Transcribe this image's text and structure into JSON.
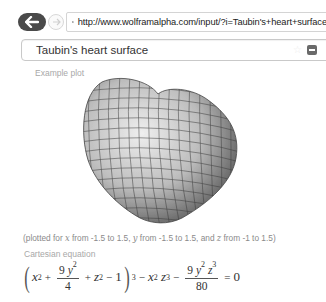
{
  "browser": {
    "url": "http://www.wolframalpha.com/input/?i=Taubin's+heart+surface",
    "back_icon": "arrow-left-icon",
    "forward_icon": "arrow-right-icon",
    "site_icon": "gear-icon"
  },
  "search": {
    "query": "Taubin's heart surface",
    "favorite_icon": "star-icon",
    "clear_icon": "minus-square-icon"
  },
  "pods": {
    "example_plot": {
      "title": "Example plot",
      "caption_parts": [
        "(plotted for ",
        "x",
        " from -1.5 to 1.5, ",
        "y",
        " from -1.5 to 1.5, and ",
        "z",
        " from -1 to 1.5)"
      ]
    },
    "cartesian": {
      "title": "Cartesian equation",
      "eq": {
        "open_paren": "(",
        "x": "x",
        "sq": "2",
        "plus1": "+",
        "frac1_num_coef": "9",
        "frac1_num_var": "y",
        "frac1_num_exp": "2",
        "frac1_den": "4",
        "plus2": "+",
        "z": "z",
        "z_exp": "2",
        "minus1": "−",
        "one": "1",
        "close_paren": ")",
        "cube": "3",
        "minus2": "−",
        "x2": "x",
        "x2_exp": "2",
        "z2": "z",
        "z2_exp": "3",
        "minus3": "−",
        "frac2_num_coef": "9",
        "frac2_num_y": "y",
        "frac2_num_y_exp": "2",
        "frac2_num_z": "z",
        "frac2_num_z_exp": "3",
        "frac2_den": "80",
        "equals": "=",
        "rhs": "0"
      }
    }
  }
}
